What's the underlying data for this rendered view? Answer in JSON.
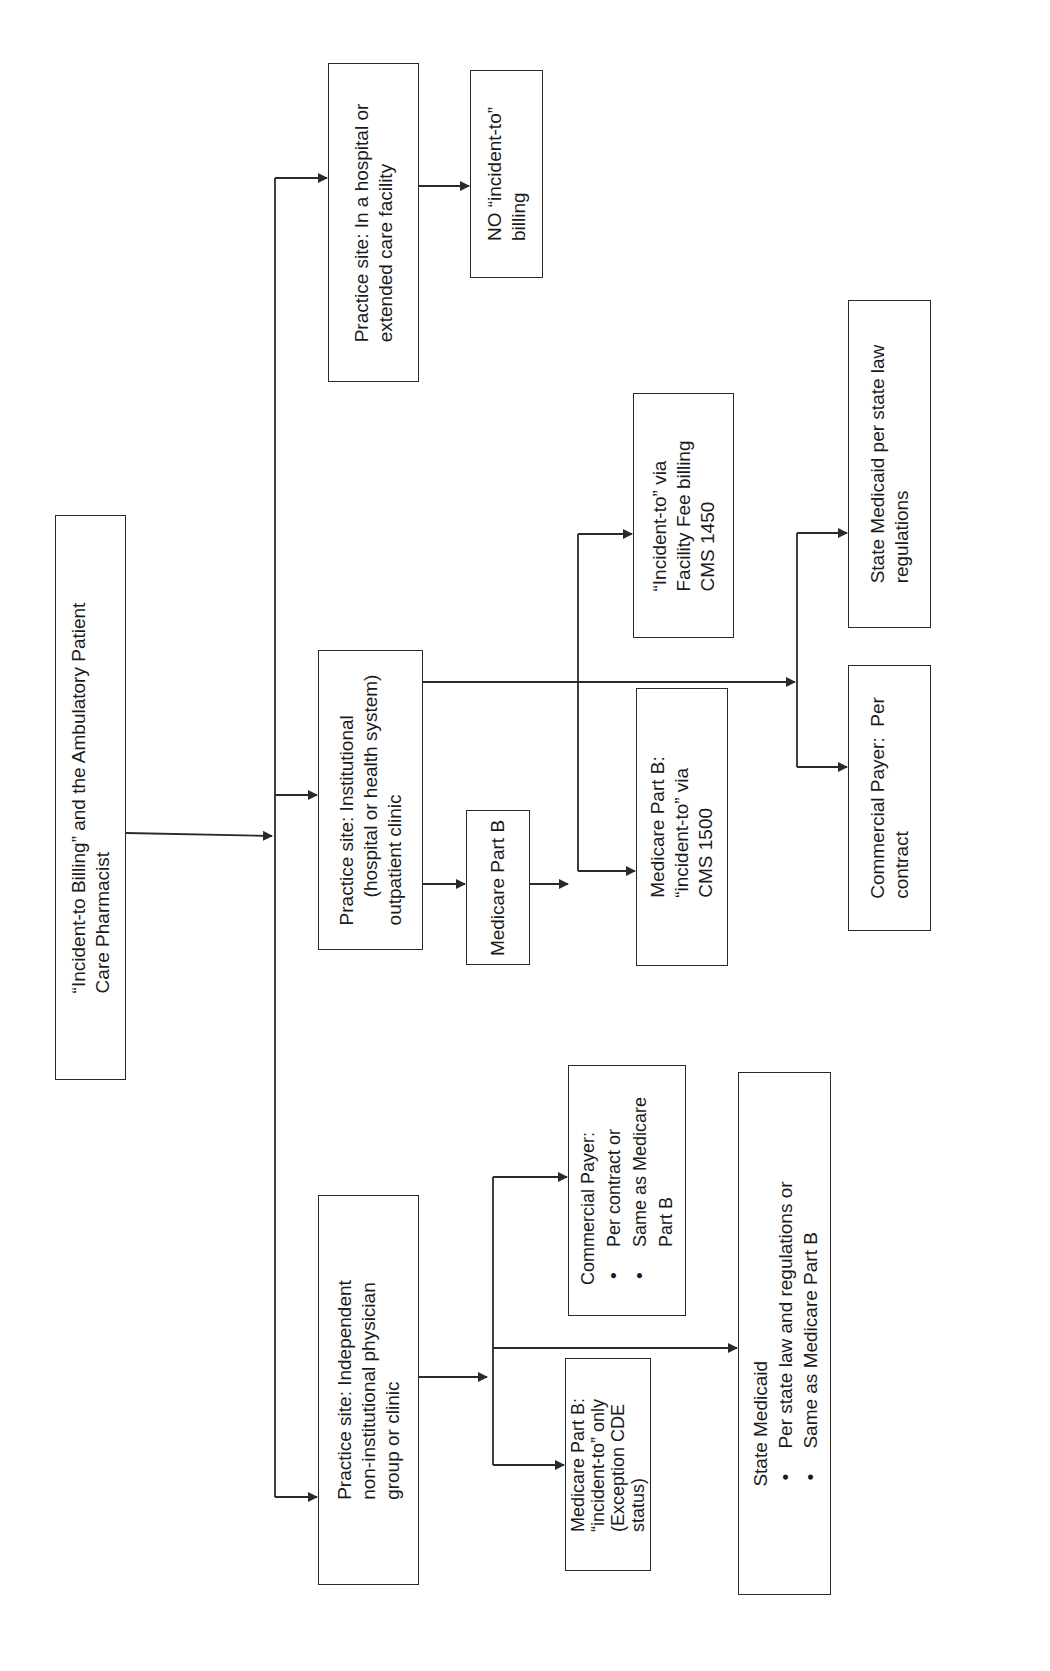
{
  "diagram": {
    "orientation": "rotated-90-ccw",
    "line_color": "#2a2a2a",
    "root": {
      "id": "root",
      "lines": [
        "“Incident-to Billing” and the Ambulatory Patient",
        "Care Pharmacist"
      ]
    },
    "branches": {
      "independent": {
        "id": "practice-independent",
        "lines": [
          "Practice site: Independent",
          "non-institutional physician",
          "group or clinic"
        ],
        "children": {
          "medicare": {
            "lines": [
              "Medicare Part B:",
              "“incident-to” only",
              "(Exception CDE",
              "status)"
            ]
          },
          "commercial": {
            "heading": "Commercial Payer:",
            "bullets": [
              {
                "lines": [
                  "Per contract or"
                ]
              },
              {
                "lines": [
                  "Same as Medicare",
                  "Part B"
                ]
              }
            ]
          },
          "medicaid": {
            "heading": "State Medicaid",
            "bullets": [
              {
                "lines": [
                  "Per state law and regulations or"
                ]
              },
              {
                "lines": [
                  "Same as Medicare Part B"
                ]
              }
            ]
          }
        }
      },
      "institutional": {
        "id": "practice-institutional",
        "lines": [
          "Practice site: Institutional",
          "(hospital or health system)",
          "outpatient clinic"
        ],
        "medicare_part_b": {
          "lines": [
            "Medicare Part B"
          ]
        },
        "children": {
          "cms1500": {
            "lines": [
              "Medicare Part B:",
              "“incident-to” via",
              "CMS 1500"
            ]
          },
          "cms1450": {
            "lines": [
              "“Incident-to” via",
              "Facility Fee billing",
              "CMS 1450"
            ]
          },
          "commercial": {
            "lines": [
              "Commercial Payer:  Per",
              "contract"
            ]
          },
          "medicaid": {
            "lines": [
              "State Medicaid per state law",
              "regulations"
            ]
          }
        }
      },
      "hospital": {
        "id": "practice-hospital",
        "lines": [
          "Practice site: In a hospital or",
          "extended care facility"
        ],
        "children": {
          "no_billing": {
            "lines": [
              "NO “incident-to”",
              "billing"
            ]
          }
        }
      }
    }
  }
}
